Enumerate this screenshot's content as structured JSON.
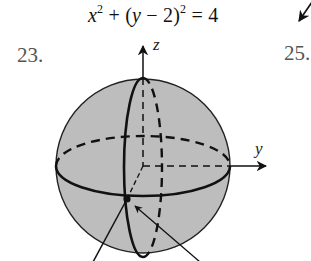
{
  "equation": {
    "x_term": "x",
    "exp1": "2",
    "plus": " + (",
    "y_term": "y",
    "minus_part": " − 2)",
    "exp2": "2",
    "equals": " = 4"
  },
  "problems": {
    "left_number": "23.",
    "right_number": "25."
  },
  "figure": {
    "type": "sphere",
    "axis_labels": {
      "z": "z",
      "y": "y"
    },
    "colors": {
      "sphere_fill": "#bdbdbd",
      "stroke": "#111111",
      "number_text": "#555555"
    }
  }
}
